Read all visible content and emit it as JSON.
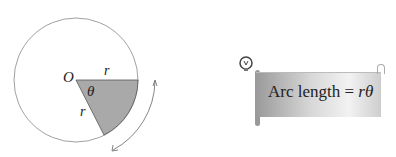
{
  "diagram": {
    "center_label": "O",
    "radius_label_top": "r",
    "radius_label_side": "r",
    "angle_label": "θ",
    "sector_color": "#a9a9a9"
  },
  "note": {
    "icon": "lightbulb-icon",
    "text_prefix": "Arc length = ",
    "text_var1": "r",
    "text_var2": "θ"
  }
}
